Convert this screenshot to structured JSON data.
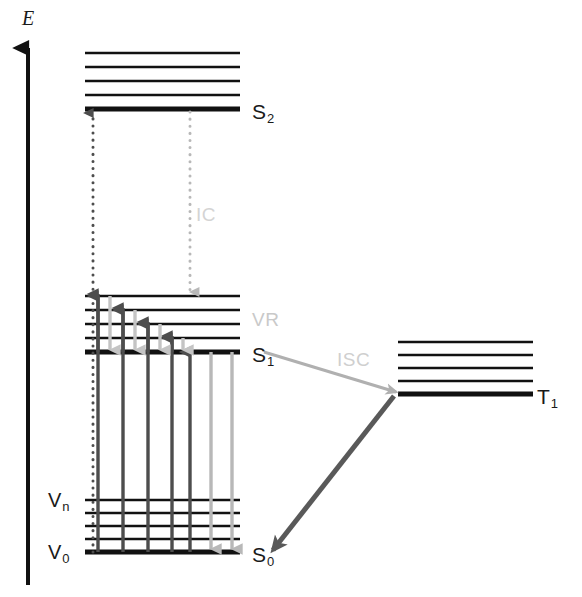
{
  "figure": {
    "background": "#ffffff"
  },
  "axis": {
    "label": "E",
    "name": "energy-axis",
    "color": "#111111",
    "x": 28,
    "y_top": 48,
    "y_bottom": 585,
    "label_x": 22,
    "label_y": 18
  },
  "colors": {
    "level_line": "#111111",
    "absorption_arrow": "#4d4d4d",
    "emission_arrow": "#b3b3b3",
    "vr_up_arrow": "#4d4d4d",
    "vr_down_arrow": "#bfbfbf",
    "ic_arrow": "#808080",
    "isc_arrow": "#b0b0b0",
    "phos_arrow": "#595959",
    "ic_label": "#d4d4d4",
    "vr_label": "#c9c9c9",
    "isc_label": "#cfcfcf",
    "state_label": "#1a1a1a"
  },
  "states": [
    {
      "id": "S2",
      "label": "S",
      "sub": "2",
      "label_x": 252,
      "label_y": 101,
      "x1": 85,
      "x2": 240,
      "base_y": 109,
      "base_thickness": 5,
      "vib_thickness": 2.5,
      "vib_levels_y": [
        53,
        67,
        81,
        95
      ]
    },
    {
      "id": "S1",
      "label": "S",
      "sub": "1",
      "label_x": 252,
      "label_y": 344,
      "x1": 85,
      "x2": 240,
      "base_y": 352,
      "base_thickness": 5,
      "vib_thickness": 2.5,
      "vib_levels_y": [
        296,
        310,
        324,
        338
      ]
    },
    {
      "id": "T1",
      "label": "T",
      "sub": "1",
      "label_x": 537,
      "label_y": 386,
      "x1": 398,
      "x2": 533,
      "base_y": 394,
      "base_thickness": 5,
      "vib_thickness": 2.5,
      "vib_levels_y": [
        342,
        355,
        368,
        381
      ]
    },
    {
      "id": "S0",
      "label": "S",
      "sub": "0",
      "label_x": 252,
      "label_y": 544,
      "x1": 85,
      "x2": 240,
      "base_y": 552,
      "base_thickness": 5,
      "vib_thickness": 2.5,
      "vib_levels_y": [
        500,
        513,
        526,
        539
      ]
    }
  ],
  "vibrational_labels": [
    {
      "name": "vib-level-n",
      "label": "V",
      "sub": "n",
      "x": 48,
      "y": 492
    },
    {
      "name": "vib-level-0",
      "label": "V",
      "sub": "0",
      "x": 48,
      "y": 544
    }
  ],
  "process_labels": [
    {
      "name": "internal-conversion-label",
      "text": "IC",
      "x": 196,
      "y": 205,
      "color": "#d4d4d4"
    },
    {
      "name": "vibrational-relaxation-label",
      "text": "VR",
      "x": 252,
      "y": 310,
      "color": "#c9c9c9"
    },
    {
      "name": "intersystem-crossing-label",
      "text": "ISC",
      "x": 337,
      "y": 350,
      "color": "#cfcfcf"
    }
  ],
  "transitions": {
    "excitation_to_s2": {
      "name": "excitation-arrow-s0-to-s2",
      "style": "dotted",
      "color": "#4d4d4d",
      "x": 93,
      "y_from": 552,
      "y_to": 113,
      "direction": "up",
      "width": 3
    },
    "internal_conversion": {
      "name": "internal-conversion-arrow",
      "style": "dotted",
      "color": "#b8b8b8",
      "x": 190,
      "y_from": 112,
      "y_to": 292,
      "direction": "down",
      "width": 3
    },
    "absorption_arrows": [
      {
        "name": "absorption-arrow-1",
        "x": 98,
        "y_from": 552,
        "y_to": 296,
        "color": "#4d4d4d",
        "width": 3.4
      },
      {
        "name": "absorption-arrow-2",
        "x": 123,
        "y_from": 552,
        "y_to": 310,
        "color": "#4d4d4d",
        "width": 3.4
      },
      {
        "name": "absorption-arrow-3",
        "x": 148,
        "y_from": 552,
        "y_to": 324,
        "color": "#4d4d4d",
        "width": 3.4
      },
      {
        "name": "absorption-arrow-4",
        "x": 172,
        "y_from": 552,
        "y_to": 338,
        "color": "#4d4d4d",
        "width": 3.4
      },
      {
        "name": "absorption-arrow-5",
        "x": 190,
        "y_from": 552,
        "y_to": 352,
        "color": "#4d4d4d",
        "width": 3.4
      }
    ],
    "fluorescence_arrows": [
      {
        "name": "fluorescence-arrow-1",
        "x": 211,
        "y_from": 352,
        "y_to": 549,
        "color": "#b8b8b8",
        "width": 3.4
      },
      {
        "name": "fluorescence-arrow-2",
        "x": 232,
        "y_from": 352,
        "y_to": 549,
        "color": "#b8b8b8",
        "width": 3.4
      }
    ],
    "vr_up_arrows": [
      {
        "name": "vr-up-arrow-1",
        "x": 98,
        "y_from": 352,
        "y_to": 294,
        "color": "#4d4d4d",
        "width": 3.4
      },
      {
        "name": "vr-up-arrow-2",
        "x": 123,
        "y_from": 352,
        "y_to": 308,
        "color": "#4d4d4d",
        "width": 3.4
      },
      {
        "name": "vr-up-arrow-3",
        "x": 148,
        "y_from": 352,
        "y_to": 322,
        "color": "#4d4d4d",
        "width": 3.4
      },
      {
        "name": "vr-up-arrow-4",
        "x": 172,
        "y_from": 352,
        "y_to": 336,
        "color": "#4d4d4d",
        "width": 3.4
      }
    ],
    "vr_down_arrows": [
      {
        "name": "vr-down-arrow-1",
        "x": 110,
        "y_from": 296,
        "y_to": 350,
        "color": "#c4c4c4",
        "width": 3.4
      },
      {
        "name": "vr-down-arrow-2",
        "x": 135,
        "y_from": 310,
        "y_to": 350,
        "color": "#c4c4c4",
        "width": 3.4
      },
      {
        "name": "vr-down-arrow-3",
        "x": 160,
        "y_from": 324,
        "y_to": 350,
        "color": "#c4c4c4",
        "width": 3.4
      },
      {
        "name": "vr-down-arrow-4",
        "x": 183,
        "y_from": 338,
        "y_to": 350,
        "color": "#c4c4c4",
        "width": 3.4
      }
    ],
    "isc_arrow": {
      "name": "intersystem-crossing-arrow",
      "x_from": 264,
      "y_from": 352,
      "x_to": 396,
      "y_to": 392,
      "color": "#b0b0b0",
      "width": 3
    },
    "phosphorescence_arrow": {
      "name": "phosphorescence-arrow",
      "x_from": 394,
      "y_from": 396,
      "x_to": 273,
      "y_to": 550,
      "color": "#595959",
      "width": 5
    }
  }
}
